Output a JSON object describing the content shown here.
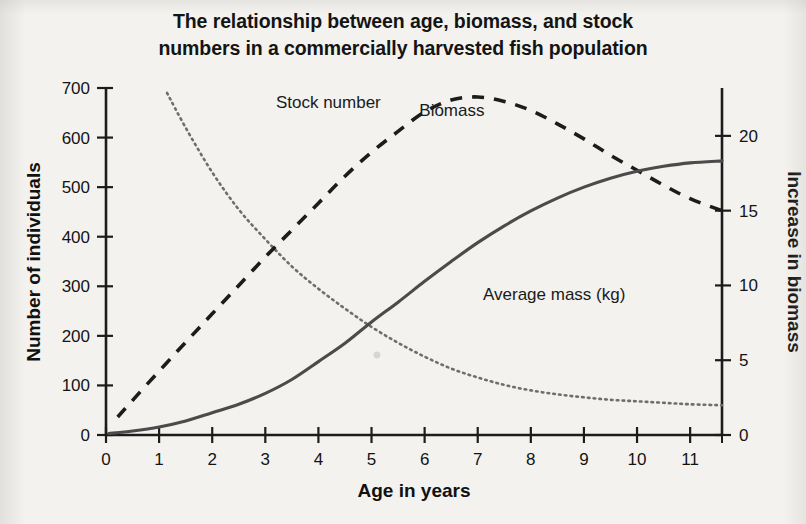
{
  "title": {
    "line1": "The relationship between age, biomass, and stock",
    "line2": "numbers in a commercially harvested fish population"
  },
  "chart_data": {
    "type": "line",
    "title": "The relationship between age, biomass, and stock numbers in a commercially harvested fish population",
    "xlabel": "Age in years",
    "ylabel": "Number of individuals",
    "y2label": "Increase in biomass",
    "xlim": [
      0,
      11.6
    ],
    "ylim": [
      0,
      700
    ],
    "y2lim": [
      0,
      23.2
    ],
    "xticks": [
      0,
      1,
      2,
      3,
      4,
      5,
      6,
      7,
      8,
      9,
      10,
      11
    ],
    "xticklabels": [
      "0",
      "1",
      "2",
      "3",
      "4",
      "5",
      "6",
      "7",
      "8",
      "9",
      "10",
      "11"
    ],
    "yticks": [
      0,
      100,
      200,
      300,
      400,
      500,
      600,
      700
    ],
    "yticklabels": [
      "0",
      "100",
      "200",
      "300",
      "400",
      "500",
      "600",
      "700"
    ],
    "y2ticks": [
      0,
      5,
      10,
      15,
      20
    ],
    "y2ticklabels": [
      "0",
      "5",
      "10",
      "15",
      "20"
    ],
    "grid": false,
    "legend": "inline-annotations",
    "series": [
      {
        "name": "Stock number",
        "style": "dotted",
        "axis": "left",
        "units": "number of individuals",
        "label_x": 3.2,
        "label_y": 660,
        "x": [
          1.15,
          1.5,
          2.0,
          2.5,
          3.0,
          3.5,
          4.0,
          4.5,
          5.0,
          5.5,
          6.0,
          6.5,
          7.0,
          7.5,
          8.0,
          8.5,
          9.0,
          9.5,
          10.0,
          10.5,
          11.0,
          11.6
        ],
        "y": [
          690,
          620,
          530,
          455,
          395,
          340,
          295,
          255,
          218,
          186,
          158,
          134,
          116,
          101,
          90,
          82,
          76,
          71,
          68,
          65,
          62,
          60
        ]
      },
      {
        "name": "Biomass",
        "style": "dashed",
        "axis": "right",
        "units": "increase in biomass",
        "label_x": 5.9,
        "label_y": 21.3,
        "x": [
          0.22,
          0.75,
          1.5,
          2.0,
          2.5,
          3.0,
          3.5,
          4.0,
          4.5,
          5.0,
          5.5,
          6.0,
          6.5,
          7.0,
          7.5,
          8.0,
          8.5,
          9.0,
          9.5,
          10.0,
          10.5,
          11.0,
          11.6
        ],
        "y": [
          1.2,
          3.3,
          6.2,
          8.1,
          10.0,
          11.9,
          13.7,
          15.5,
          17.3,
          18.9,
          20.3,
          21.6,
          22.4,
          22.6,
          22.3,
          21.7,
          20.8,
          19.8,
          18.7,
          17.7,
          16.7,
          15.8,
          15.0
        ]
      },
      {
        "name": "Average mass (kg)",
        "style": "solid",
        "axis": "left",
        "units": "number of individuals",
        "label_x": 7.1,
        "label_y": 272,
        "x": [
          0.05,
          0.5,
          1.0,
          1.5,
          2.0,
          2.5,
          3.0,
          3.5,
          4.0,
          4.5,
          5.0,
          5.5,
          6.0,
          6.5,
          7.0,
          7.5,
          8.0,
          8.5,
          9.0,
          9.5,
          10.0,
          10.5,
          11.0,
          11.6
        ],
        "y": [
          3,
          8,
          16,
          28,
          45,
          62,
          84,
          112,
          148,
          185,
          228,
          268,
          310,
          350,
          388,
          422,
          452,
          478,
          500,
          518,
          532,
          542,
          549,
          553
        ]
      }
    ]
  },
  "colors": {
    "background": "#f3f2ef",
    "axis": "#1c1c1c",
    "solid_series": "#4b4b4b",
    "dashed_series": "#1c1c1c",
    "dotted_series": "#6e6e6e",
    "text": "#141414"
  }
}
